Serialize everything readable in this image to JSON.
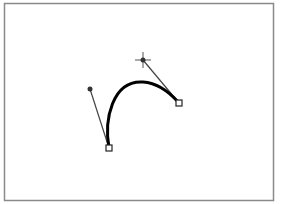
{
  "diagram": {
    "type": "bezier-curve-edit",
    "frame": {
      "x": 4.5,
      "y": 3.5,
      "width": 269,
      "height": 197,
      "stroke": "#8a8a8a"
    },
    "curve": {
      "start": [
        109,
        148
      ],
      "control1": [
        90,
        89
      ],
      "control2": [
        143,
        60
      ],
      "end": [
        179,
        103
      ],
      "stroke": "#000000",
      "stroke_width": 3
    },
    "handles": [
      {
        "from": [
          109,
          148
        ],
        "to": [
          90,
          89
        ],
        "marker": "dot"
      },
      {
        "from": [
          179,
          103
        ],
        "to": [
          143,
          60
        ],
        "marker": "crosshair"
      }
    ],
    "anchors": [
      {
        "center": [
          109,
          148
        ],
        "shape": "square"
      },
      {
        "center": [
          179,
          103
        ],
        "shape": "square"
      }
    ],
    "colors": {
      "handle_line": "#444444",
      "anchor_fill": "#ffffff",
      "anchor_stroke": "#222222"
    }
  }
}
